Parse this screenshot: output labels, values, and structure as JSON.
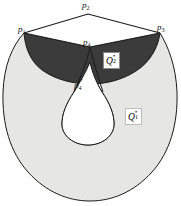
{
  "figure": {
    "type": "geometric-diagram",
    "background_color": "#ffffff",
    "caption": "",
    "colors": {
      "outer_region_fill": "#e6e6e4",
      "crescent_fill": "#3b3b3b",
      "quadrilateral_fill": "#ffffff",
      "hole_fill": "#ffffff",
      "stroke": "#1a1a1a"
    },
    "vertices": [
      {
        "id": "p1",
        "letter": "p",
        "subscript": "1",
        "prime": "",
        "x": 24,
        "y": 33
      },
      {
        "id": "p2",
        "letter": "p",
        "subscript": "2",
        "prime": "",
        "x": 88,
        "y": 7
      },
      {
        "id": "p3",
        "letter": "p",
        "subscript": "3",
        "prime": "",
        "x": 160,
        "y": 31
      },
      {
        "id": "p4",
        "letter": "p",
        "subscript": "4",
        "prime": "",
        "x": 90,
        "y": 44
      },
      {
        "id": "p4prime",
        "letter": "p",
        "subscript": "4",
        "prime": "′",
        "x": 80,
        "y": 88
      }
    ],
    "regions": [
      {
        "id": "Q2",
        "letter": "Q",
        "subscript": "2",
        "superscript": "•",
        "fill": "#3b3b3b",
        "label_x": 103,
        "label_y": 55
      },
      {
        "id": "Q1",
        "letter": "Q",
        "subscript": "1",
        "superscript": "•",
        "fill": "#e6e6e4",
        "label_x": 126,
        "label_y": 111
      }
    ]
  }
}
